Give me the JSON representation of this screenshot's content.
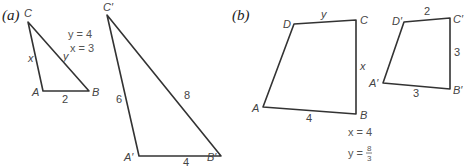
{
  "figure_a": {
    "part_label": "(a)",
    "triangle_small": {
      "vertices": {
        "A": "A",
        "B": "B",
        "C": "C"
      },
      "sides": {
        "AB": "2",
        "AC": "x",
        "BC": "y"
      }
    },
    "solution": {
      "y": "y = 4",
      "x": "x = 3"
    },
    "triangle_large": {
      "vertices": {
        "A": "A′",
        "B": "B′",
        "C": "C′"
      },
      "sides": {
        "AB": "4",
        "AC": "6",
        "BC": "8"
      }
    }
  },
  "figure_b": {
    "part_label": "(b)",
    "quad_large": {
      "vertices": {
        "A": "A",
        "B": "B",
        "C": "C",
        "D": "D"
      },
      "sides": {
        "AB": "4",
        "DC": "y",
        "CB": "x"
      }
    },
    "solution": {
      "x": "x = 4",
      "y_prefix": "y =",
      "y_num": "8",
      "y_den": "3"
    },
    "quad_small": {
      "vertices": {
        "A": "A′",
        "B": "B′",
        "C": "C′",
        "D": "D′"
      },
      "sides": {
        "DC": "2",
        "CB": "3",
        "AB": "3"
      }
    }
  }
}
